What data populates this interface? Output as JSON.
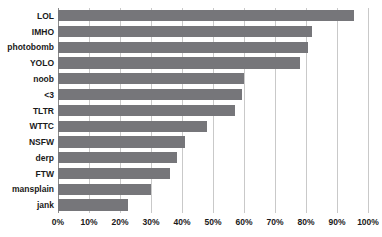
{
  "chart_data": {
    "type": "bar",
    "orientation": "horizontal",
    "title": "",
    "xlabel": "",
    "ylabel": "",
    "xlim": [
      0,
      100
    ],
    "xticks": [
      0,
      10,
      20,
      30,
      40,
      50,
      60,
      70,
      80,
      90,
      100
    ],
    "xtick_labels": [
      "0%",
      "10%",
      "20%",
      "30%",
      "40%",
      "50%",
      "60%",
      "70%",
      "80%",
      "90%",
      "100%"
    ],
    "grid": "vertical",
    "legend": "none",
    "bar_color": "#76767a",
    "grid_color": "#c9c9c9",
    "categories": [
      "LOL",
      "IMHO",
      "photobomb",
      "YOLO",
      "noob",
      "<3",
      "TLTR",
      "WTTC",
      "NSFW",
      "derp",
      "FTW",
      "mansplain",
      "jank"
    ],
    "values": [
      95.5,
      82.0,
      80.5,
      78.0,
      60.0,
      59.5,
      57.0,
      48.0,
      41.0,
      38.5,
      36.0,
      30.0,
      22.5
    ]
  }
}
